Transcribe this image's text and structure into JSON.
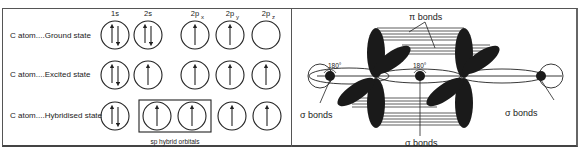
{
  "figure": {
    "left_panel": {
      "title": "Orbital diagram of carbon sp hybridization",
      "columns": [
        {
          "label": "1s",
          "sub": ""
        },
        {
          "label": "2s",
          "sub": ""
        },
        {
          "label": "2p",
          "sub": "x"
        },
        {
          "label": "2p",
          "sub": "y"
        },
        {
          "label": "2p",
          "sub": "z"
        }
      ],
      "rows": [
        {
          "label": "C atom....Ground state",
          "orbitals": [
            "up-down",
            "up-down",
            "up",
            "up",
            "empty"
          ]
        },
        {
          "label": "C atom....Excited state",
          "orbitals": [
            "up-down",
            "up",
            "up",
            "up",
            "up"
          ]
        },
        {
          "label": "C atom....Hybridised state",
          "orbitals": [
            "up-down",
            "up",
            "up",
            "up",
            "up"
          ]
        }
      ],
      "hybrid_box_label": "sp hybrid orbitals"
    },
    "right_panel": {
      "title": "Sigma and pi bonds in sp-hybridized carbon chain",
      "pi_label": "π bonds",
      "angle_labels": [
        "180°",
        "180°"
      ],
      "sigma_labels": [
        "σ  bonds",
        "σ  bonds",
        "σ  bonds"
      ]
    },
    "colors": {
      "ink": "#1a1a1a",
      "border": "#555555",
      "background": "#ffffff"
    }
  }
}
